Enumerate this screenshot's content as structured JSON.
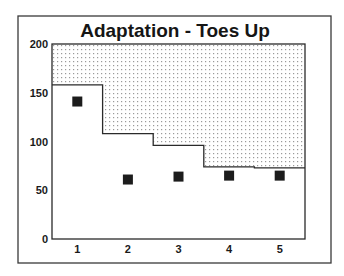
{
  "chart_data": {
    "type": "line",
    "subtype": "step-area-with-markers",
    "title": "Adaptation - Toes Up",
    "xlabel": "",
    "ylabel": "",
    "categories": [
      "1",
      "2",
      "3",
      "4",
      "5"
    ],
    "x": [
      1,
      2,
      3,
      4,
      5
    ],
    "series": [
      {
        "name": "threshold (step, shaded above)",
        "style": "step",
        "fill_above": "dotted",
        "values": [
          158,
          108,
          96,
          74,
          73
        ]
      },
      {
        "name": "measurement",
        "style": "square-marker",
        "values": [
          141,
          61,
          64,
          65,
          65
        ]
      }
    ],
    "ylim": [
      0,
      200
    ],
    "yticks": [
      0,
      50,
      100,
      150,
      200
    ],
    "xticks": [
      1,
      2,
      3,
      4,
      5
    ],
    "grid": false,
    "legend": null
  },
  "labels": {
    "title": "Adaptation - Toes Up",
    "y_ticks": [
      "0",
      "50",
      "100",
      "150",
      "200"
    ],
    "x_ticks": [
      "1",
      "2",
      "3",
      "4",
      "5"
    ]
  },
  "colors": {
    "ink": "#1c1c1c",
    "pattern_dot": "#9a9a9a",
    "background": "#ffffff"
  }
}
